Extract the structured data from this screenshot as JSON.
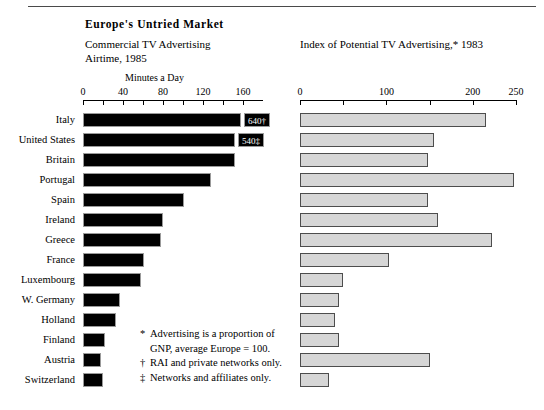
{
  "header": {
    "title": "Europe's  Untried  Market",
    "left_subtitle_line1": "Commercial  TV  Advertising",
    "left_subtitle_line2": "Airtime,  1985",
    "right_subtitle": "Index of  Potential  TV  Advertising,*  1983",
    "left_units": "Minutes a Day"
  },
  "footnotes": {
    "star_mark": "*",
    "star_line1": "Advertising is a proportion of",
    "star_line2": "GNP, average Europe = 100.",
    "dagger_mark": "†",
    "dagger_text": "RAI and private networks only.",
    "dbldagger_mark": "‡",
    "dbldagger_text": "Networks and affiliates only."
  },
  "colors": {
    "bar_left": "#010101",
    "bar_right": "#d6d6d6",
    "bar_right_border": "#4d4d4d",
    "rule": "#4a4a4a",
    "text": "#000000"
  },
  "chart_data": [
    {
      "type": "bar",
      "orientation": "horizontal",
      "title": "Commercial TV Advertising Airtime, 1985",
      "xlabel": "Minutes a Day",
      "ylabel": "",
      "xlim": [
        0,
        180
      ],
      "xticks": [
        0,
        20,
        40,
        60,
        80,
        100,
        120,
        140,
        160
      ],
      "xticklabels": [
        "0",
        "",
        "40",
        "",
        "80",
        "",
        "120",
        "",
        "160"
      ],
      "grid": false,
      "legend": "none",
      "categories": [
        "Italy",
        "United States",
        "Britain",
        "Portugal",
        "Spain",
        "Ireland",
        "Greece",
        "France",
        "Luxembourg",
        "W. Germany",
        "Holland",
        "Finland",
        "Austria",
        "Switzerland"
      ],
      "values": [
        158,
        152,
        152,
        128,
        101,
        80,
        78,
        61,
        58,
        37,
        33,
        22,
        18,
        20
      ],
      "data_labels": [
        "640†",
        "540‡",
        "",
        "",
        "",
        "",
        "",
        "",
        "",
        "",
        "",
        "",
        "",
        ""
      ]
    },
    {
      "type": "bar",
      "orientation": "horizontal",
      "title": "Index of Potential TV Advertising,* 1983",
      "xlabel": "",
      "ylabel": "",
      "xlim": [
        0,
        250
      ],
      "xticks": [
        0,
        50,
        100,
        150,
        200,
        250
      ],
      "xticklabels": [
        "0",
        "",
        "100",
        "",
        "200",
        "250"
      ],
      "grid": false,
      "legend": "none",
      "categories": [
        "Italy",
        "United States",
        "Britain",
        "Portugal",
        "Spain",
        "Ireland",
        "Greece",
        "France",
        "Luxembourg",
        "W. Germany",
        "Holland",
        "Finland",
        "Austria",
        "Switzerland"
      ],
      "values": [
        215,
        155,
        148,
        248,
        148,
        160,
        222,
        103,
        50,
        45,
        40,
        45,
        150,
        33
      ]
    }
  ]
}
